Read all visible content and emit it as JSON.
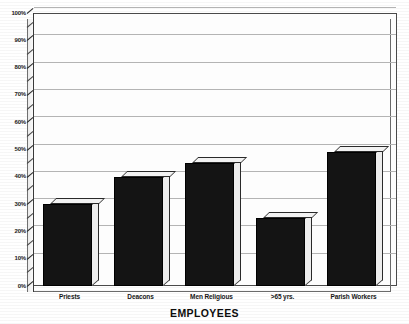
{
  "chart_data": {
    "type": "bar",
    "title": "",
    "subtitle": "",
    "xlabel": "EMPLOYEES",
    "ylabel": "",
    "categories": [
      "Priests",
      "Deacons",
      "Men Religious",
      ">65 yrs.",
      "Parish Workers"
    ],
    "values": [
      30,
      40,
      45,
      25,
      49
    ],
    "ylim": [
      0,
      100
    ],
    "y_tick_labels": [
      "0%",
      "10%",
      "20%",
      "30%",
      "40%",
      "50%",
      "60%",
      "70%",
      "80%",
      "90%",
      "100%"
    ],
    "y_tick_values": [
      0,
      10,
      20,
      30,
      40,
      50,
      60,
      70,
      80,
      90,
      100
    ],
    "y_minor_tick_step": 5,
    "grid": true,
    "grid_axis": "y",
    "legend": false,
    "legend_position": "none",
    "style": "3d-column",
    "bar_color": "#141414",
    "bar_top_color": "#f2f2f2",
    "bar_side_color": "#ededed",
    "grid_color": "#c9c9c9",
    "plot_background": "#fdfdfd",
    "page_background": "#ffffff",
    "units": "percent"
  }
}
